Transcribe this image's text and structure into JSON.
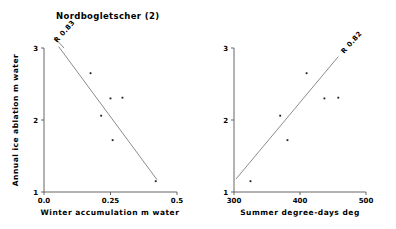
{
  "figure": {
    "title": "Nordbogletscher (2)",
    "background_color": "#ffffff",
    "axis_color": "#555555",
    "point_color": "#1a1a1a",
    "fit_line_color": "#777777"
  },
  "chart_data": [
    {
      "type": "scatter",
      "panel": "left",
      "title": "Nordbogletscher (2)",
      "xlabel": "Winter accumulation m water",
      "ylabel": "Annual ice ablation m water",
      "xlim": [
        0.0,
        0.5
      ],
      "ylim": [
        1,
        3
      ],
      "xticks": [
        0.0,
        0.25,
        0.5
      ],
      "xtick_labels": [
        "0.0",
        "0.25",
        "0.5"
      ],
      "yticks": [
        1,
        2,
        3
      ],
      "ytick_labels": [
        "1",
        "2",
        "3"
      ],
      "grid": false,
      "legend": "none",
      "annotation": "R 0.83",
      "annotation_rotation_deg": -48,
      "trend": "negative",
      "fit_line": {
        "x0": 0.055,
        "y0": 3.02,
        "x1": 0.425,
        "y1": 1.17
      },
      "x": [
        0.175,
        0.25,
        0.295,
        0.215,
        0.258,
        0.42
      ],
      "y": [
        2.65,
        2.3,
        2.31,
        2.06,
        1.72,
        1.15
      ],
      "points": [
        {
          "x": 0.175,
          "y": 2.65
        },
        {
          "x": 0.25,
          "y": 2.3
        },
        {
          "x": 0.295,
          "y": 2.31
        },
        {
          "x": 0.215,
          "y": 2.06
        },
        {
          "x": 0.258,
          "y": 1.72
        },
        {
          "x": 0.42,
          "y": 1.15
        }
      ]
    },
    {
      "type": "scatter",
      "panel": "right",
      "title": "",
      "xlabel": "Summer degree-days deg",
      "ylabel": "Annual ice ablation m water",
      "xlim": [
        300,
        500
      ],
      "ylim": [
        1,
        3
      ],
      "xticks": [
        300,
        400,
        500
      ],
      "xtick_labels": [
        "300",
        "400",
        "500"
      ],
      "yticks": [
        1,
        2,
        3
      ],
      "ytick_labels": [
        "1",
        "2",
        "3"
      ],
      "grid": false,
      "legend": "none",
      "annotation": "R 0.82",
      "annotation_rotation_deg": -48,
      "trend": "positive",
      "fit_line": {
        "x0": 303,
        "y0": 1.18,
        "x1": 458,
        "y1": 2.88
      },
      "x": [
        410,
        437,
        458,
        370,
        381,
        325
      ],
      "y": [
        2.65,
        2.3,
        2.31,
        2.06,
        1.72,
        1.15
      ],
      "points": [
        {
          "x": 410,
          "y": 2.65
        },
        {
          "x": 437,
          "y": 2.3
        },
        {
          "x": 458,
          "y": 2.31
        },
        {
          "x": 370,
          "y": 2.06
        },
        {
          "x": 381,
          "y": 1.72
        },
        {
          "x": 325,
          "y": 1.15
        }
      ]
    }
  ]
}
